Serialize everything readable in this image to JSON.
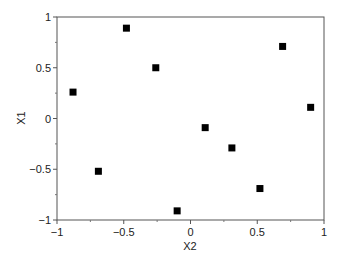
{
  "chart_data": {
    "type": "scatter",
    "title": "",
    "xlabel": "X2",
    "ylabel": "X1",
    "xlim": [
      -1,
      1
    ],
    "ylim": [
      -1,
      1
    ],
    "grid": false,
    "legend": null,
    "marker": "square",
    "marker_color": "#000000",
    "x_ticks": [
      -1,
      -0.5,
      0,
      0.5,
      1
    ],
    "x_tick_labels": [
      "−1",
      "−0.5",
      "0",
      "0.5",
      "1"
    ],
    "y_ticks": [
      -1,
      -0.5,
      0,
      0.5,
      1
    ],
    "y_tick_labels": [
      "−1",
      "−0.5",
      "0",
      "0.5",
      "1"
    ],
    "points": [
      {
        "x": -0.88,
        "y": 0.26
      },
      {
        "x": -0.48,
        "y": 0.89
      },
      {
        "x": -0.26,
        "y": 0.5
      },
      {
        "x": -0.69,
        "y": -0.52
      },
      {
        "x": -0.1,
        "y": -0.91
      },
      {
        "x": 0.11,
        "y": -0.09
      },
      {
        "x": 0.31,
        "y": -0.29
      },
      {
        "x": 0.52,
        "y": -0.69
      },
      {
        "x": 0.69,
        "y": 0.71
      },
      {
        "x": 0.9,
        "y": 0.11
      }
    ]
  }
}
